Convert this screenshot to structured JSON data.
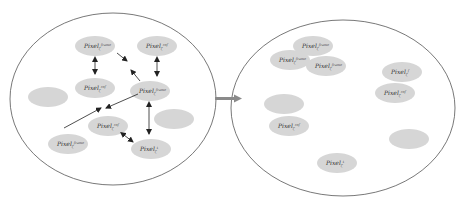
{
  "colors": {
    "blob": "#d6d6d6",
    "stroke": "#555555",
    "arrow": "#222222",
    "transition_arrow": "#8a8a8a"
  },
  "left_panel": {
    "nodes": [
      {
        "id": "a",
        "x": 95,
        "y": 46,
        "label": "Pixel",
        "sub": "ζ",
        "sup": "frame"
      },
      {
        "id": "b",
        "x": 157,
        "y": 46,
        "label": "Pixel",
        "sub": "ζ",
        "sup": "ref"
      },
      {
        "id": "c",
        "x": 95,
        "y": 88,
        "label": "Pixel",
        "sub": "ζ",
        "sup": "ref"
      },
      {
        "id": "d",
        "x": 150,
        "y": 91,
        "label": "Pixel",
        "sub": "ζ",
        "sup": "frame"
      },
      {
        "id": "e",
        "x": 108,
        "y": 126,
        "label": "Pixel",
        "sub": "ζ",
        "sup": "ref"
      },
      {
        "id": "f",
        "x": 68,
        "y": 144,
        "label": "Pixel",
        "sub": "ζ",
        "sup": "frame"
      },
      {
        "id": "g",
        "x": 151,
        "y": 149,
        "label": "Pixel",
        "sub": "ζ",
        "sup": "t"
      },
      {
        "id": "h",
        "x": 48,
        "y": 97,
        "label": "",
        "sub": "",
        "sup": ""
      },
      {
        "id": "i",
        "x": 174,
        "y": 119,
        "label": "",
        "sub": "",
        "sup": ""
      }
    ]
  },
  "right_panel": {
    "nodes": [
      {
        "x": 313,
        "y": 46,
        "label": "Pixel",
        "sub": "ζ",
        "sup": "frame"
      },
      {
        "x": 290,
        "y": 60,
        "label": "Pixel",
        "sub": "ζ",
        "sup": "frame"
      },
      {
        "x": 326,
        "y": 66,
        "label": "Pixel",
        "sub": "ζ",
        "sup": "frame"
      },
      {
        "x": 402,
        "y": 72,
        "label": "Pixel",
        "sub": "ζ",
        "sup": "f"
      },
      {
        "x": 395,
        "y": 93,
        "label": "Pixel",
        "sub": "ζ",
        "sup": "ref"
      },
      {
        "x": 284,
        "y": 104,
        "label": "",
        "sub": "",
        "sup": ""
      },
      {
        "x": 289,
        "y": 126,
        "label": "Pixel",
        "sub": "ζ",
        "sup": "ref"
      },
      {
        "x": 409,
        "y": 139,
        "label": "",
        "sub": "",
        "sup": ""
      },
      {
        "x": 337,
        "y": 163,
        "label": "Pixel",
        "sub": "ζ",
        "sup": "t"
      }
    ]
  }
}
